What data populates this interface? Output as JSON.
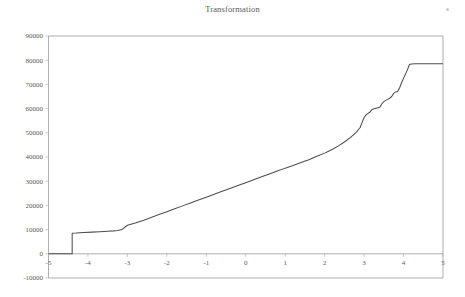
{
  "chart_data": {
    "type": "line",
    "title": "Transformation",
    "xlabel": "",
    "ylabel": "",
    "xlim": [
      -5,
      5
    ],
    "ylim": [
      -10000,
      90000
    ],
    "grid": false,
    "legend": null,
    "legend_position": "none",
    "x_ticks": [
      "-5",
      "-4",
      "-3",
      "-2",
      "-1",
      "0",
      "1",
      "2",
      "3",
      "4",
      "5"
    ],
    "x_tick_values": [
      -5,
      -4,
      -3,
      -2,
      -1,
      0,
      1,
      2,
      3,
      4,
      5
    ],
    "y_ticks": [
      "-10000",
      "0",
      "10000",
      "20000",
      "30000",
      "40000",
      "50000",
      "60000",
      "70000",
      "80000",
      "90000"
    ],
    "y_tick_values": [
      -10000,
      0,
      10000,
      20000,
      30000,
      40000,
      50000,
      60000,
      70000,
      80000,
      90000
    ],
    "axis_line_at_y": 0,
    "series": [
      {
        "name": "Transformation",
        "color": "#4d4d4d",
        "x": [
          -5.0,
          -4.8,
          -4.6,
          -4.45,
          -4.4,
          -4.4,
          -4.3,
          -4.1,
          -3.9,
          -3.7,
          -3.5,
          -3.35,
          -3.25,
          -3.15,
          -3.0,
          -2.8,
          -2.6,
          -2.4,
          -2.2,
          -2.0,
          -1.8,
          -1.6,
          -1.4,
          -1.2,
          -1.0,
          -0.8,
          -0.6,
          -0.4,
          -0.2,
          0.0,
          0.2,
          0.4,
          0.6,
          0.8,
          1.0,
          1.2,
          1.4,
          1.6,
          1.8,
          2.0,
          2.1,
          2.2,
          2.35,
          2.5,
          2.65,
          2.8,
          2.9,
          2.95,
          3.0,
          3.05,
          3.1,
          3.15,
          3.2,
          3.3,
          3.4,
          3.45,
          3.5,
          3.55,
          3.6,
          3.65,
          3.7,
          3.75,
          3.8,
          3.85,
          3.9,
          3.95,
          4.0,
          4.05,
          4.1,
          4.15,
          4.2,
          4.3,
          4.5,
          4.7,
          5.0
        ],
        "y": [
          0,
          0,
          0,
          0,
          0,
          8500,
          8560,
          8760,
          8960,
          9140,
          9320,
          9480,
          9650,
          9900,
          11800,
          12700,
          13800,
          15000,
          16200,
          17400,
          18600,
          19800,
          21000,
          22200,
          23400,
          24600,
          25800,
          27000,
          28200,
          29400,
          30600,
          31800,
          33000,
          34200,
          35400,
          36500,
          37700,
          38900,
          40300,
          41600,
          42400,
          43200,
          44600,
          46200,
          48000,
          50200,
          52200,
          54300,
          56300,
          57400,
          58000,
          58600,
          59600,
          60100,
          60600,
          62000,
          62900,
          63400,
          63800,
          64300,
          65000,
          66300,
          66900,
          67100,
          68600,
          70700,
          72600,
          74300,
          76100,
          78200,
          78450,
          78500,
          78520,
          78540,
          78560
        ]
      }
    ],
    "annotations": [],
    "notable_features": [
      {
        "label": "flat at zero",
        "x_range": [
          -5,
          -4.4
        ],
        "y": 0
      },
      {
        "label": "vertical jump",
        "x": -4.4,
        "from_y": 0,
        "to_y": 8500
      },
      {
        "label": "shallow plateau",
        "x_range": [
          -4.4,
          -3.2
        ],
        "y_range": [
          8500,
          9900
        ]
      },
      {
        "label": "near-linear rise",
        "x_range": [
          -3.0,
          2.1
        ],
        "y_range": [
          11800,
          42400
        ]
      },
      {
        "label": "steep bump",
        "x_range": [
          2.6,
          3.1
        ],
        "y_range": [
          48000,
          58600
        ]
      },
      {
        "label": "staircase steps",
        "x_range": [
          3.1,
          4.15
        ],
        "y_range": [
          58600,
          78200
        ]
      },
      {
        "label": "upper plateau",
        "x_range": [
          4.2,
          5.0
        ],
        "y": 78500
      }
    ]
  },
  "icons": {
    "corner_speck": "dot-icon"
  }
}
